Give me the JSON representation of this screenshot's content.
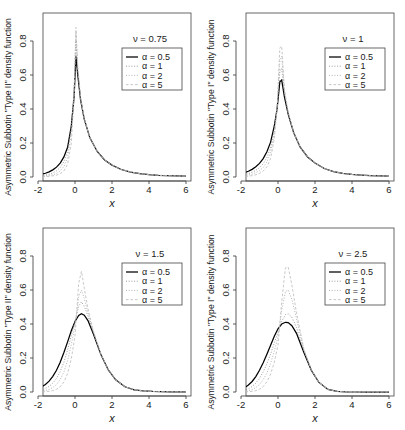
{
  "figure": {
    "layout": "2x2 grid of density plots",
    "panel_count": 4
  },
  "axes": {
    "xlabel": "x",
    "x_ticks": [
      "-2",
      "0",
      "2",
      "4",
      "6"
    ],
    "y_ticks": [
      "0.0",
      "0.2",
      "0.4",
      "0.6",
      "0.8"
    ],
    "xlim": [
      -2,
      6
    ],
    "ylim": [
      0,
      0.92
    ]
  },
  "legend": {
    "entries": [
      {
        "label": "α = 0.5",
        "style": "solid",
        "color": "#000000"
      },
      {
        "label": "α = 1",
        "style": "dotted",
        "color": "#8a8a8a"
      },
      {
        "label": "α = 2",
        "style": "dotted",
        "color": "#a8a8a8"
      },
      {
        "label": "α = 5",
        "style": "dashed",
        "color": "#bdbdbd"
      }
    ]
  },
  "panels": [
    {
      "id": "panel-top-left",
      "nu_label": "ν = 0.75",
      "ylabel": "Asymmetric Subbotin \"Type II\" density function",
      "type": "II",
      "nu": 0.75
    },
    {
      "id": "panel-top-right",
      "nu_label": "ν = 1",
      "ylabel": "Asymmetric Subbotin \"Type I\" density function",
      "type": "I",
      "nu": 1
    },
    {
      "id": "panel-bottom-left",
      "nu_label": "ν = 1.5",
      "ylabel": "Asymmetric Subbotin \"Type II\" density function",
      "type": "II",
      "nu": 1.5
    },
    {
      "id": "panel-bottom-right",
      "nu_label": "ν = 2.5",
      "ylabel": "Asymmetric Subbotin \"Type I\" density function",
      "type": "I",
      "nu": 2.5
    }
  ],
  "chart_data": [
    {
      "type": "line",
      "title": "ν = 0.75",
      "xlabel": "x",
      "ylabel": "Asymmetric Subbotin \"Type II\" density function",
      "xlim": [
        -2,
        6
      ],
      "ylim": [
        0,
        0.92
      ],
      "grid": false,
      "legend_position": "upper-right",
      "x": [
        -2,
        -1.8,
        -1.6,
        -1.4,
        -1.2,
        -1,
        -0.8,
        -0.6,
        -0.4,
        -0.2,
        -0.05,
        0.05,
        0.15,
        0.3,
        0.5,
        0.8,
        1.2,
        1.6,
        2,
        2.5,
        3,
        3.5,
        4,
        4.5,
        5,
        5.5,
        6
      ],
      "series": [
        {
          "name": "α = 0.5",
          "peak": 0.71,
          "peak_x": 0.1,
          "values": [
            0.012,
            0.016,
            0.022,
            0.03,
            0.042,
            0.058,
            0.082,
            0.118,
            0.175,
            0.3,
            0.47,
            0.71,
            0.6,
            0.455,
            0.34,
            0.232,
            0.15,
            0.1,
            0.07,
            0.044,
            0.029,
            0.02,
            0.014,
            0.01,
            0.008,
            0.006,
            0.005
          ]
        },
        {
          "name": "α = 1",
          "peak": 0.8,
          "peak_x": 0.08,
          "values": [
            0.006,
            0.008,
            0.011,
            0.016,
            0.024,
            0.036,
            0.056,
            0.09,
            0.15,
            0.29,
            0.5,
            0.8,
            0.62,
            0.46,
            0.34,
            0.232,
            0.15,
            0.1,
            0.07,
            0.044,
            0.029,
            0.02,
            0.014,
            0.01,
            0.008,
            0.006,
            0.005
          ]
        },
        {
          "name": "α = 2",
          "peak": 0.85,
          "peak_x": 0.07,
          "values": [
            0.003,
            0.004,
            0.006,
            0.009,
            0.013,
            0.021,
            0.035,
            0.062,
            0.115,
            0.255,
            0.5,
            0.85,
            0.64,
            0.465,
            0.342,
            0.232,
            0.15,
            0.1,
            0.07,
            0.044,
            0.029,
            0.02,
            0.014,
            0.01,
            0.008,
            0.006,
            0.005
          ]
        },
        {
          "name": "α = 5",
          "peak": 0.88,
          "peak_x": 0.06,
          "values": [
            0.001,
            0.002,
            0.003,
            0.004,
            0.007,
            0.011,
            0.019,
            0.036,
            0.075,
            0.2,
            0.47,
            0.88,
            0.65,
            0.47,
            0.345,
            0.233,
            0.15,
            0.1,
            0.07,
            0.044,
            0.029,
            0.02,
            0.014,
            0.01,
            0.008,
            0.006,
            0.005
          ]
        }
      ]
    },
    {
      "type": "line",
      "title": "ν = 1",
      "xlabel": "x",
      "ylabel": "Asymmetric Subbotin \"Type I\" density function",
      "xlim": [
        -2,
        6
      ],
      "ylim": [
        0,
        0.92
      ],
      "grid": false,
      "legend_position": "upper-right",
      "x": [
        -2,
        -1.8,
        -1.6,
        -1.4,
        -1.2,
        -1,
        -0.8,
        -0.6,
        -0.4,
        -0.2,
        -0.05,
        0.1,
        0.2,
        0.35,
        0.55,
        0.85,
        1.2,
        1.6,
        2,
        2.5,
        3,
        3.5,
        4,
        4.5,
        5,
        5.5,
        6
      ],
      "series": [
        {
          "name": "α = 0.5",
          "peak": 0.57,
          "peak_x": 0.18,
          "values": [
            0.02,
            0.026,
            0.034,
            0.045,
            0.06,
            0.08,
            0.108,
            0.148,
            0.205,
            0.3,
            0.4,
            0.56,
            0.57,
            0.47,
            0.37,
            0.26,
            0.175,
            0.118,
            0.082,
            0.05,
            0.032,
            0.021,
            0.015,
            0.011,
            0.008,
            0.006,
            0.005
          ]
        },
        {
          "name": "α = 1",
          "peak": 0.64,
          "peak_x": 0.16,
          "values": [
            0.011,
            0.015,
            0.02,
            0.028,
            0.039,
            0.055,
            0.078,
            0.114,
            0.172,
            0.28,
            0.405,
            0.62,
            0.64,
            0.49,
            0.375,
            0.26,
            0.175,
            0.118,
            0.082,
            0.05,
            0.032,
            0.021,
            0.015,
            0.011,
            0.008,
            0.006,
            0.005
          ]
        },
        {
          "name": "α = 2",
          "peak": 0.71,
          "peak_x": 0.15,
          "values": [
            0.006,
            0.008,
            0.012,
            0.017,
            0.025,
            0.037,
            0.056,
            0.088,
            0.143,
            0.258,
            0.405,
            0.69,
            0.71,
            0.505,
            0.38,
            0.261,
            0.175,
            0.118,
            0.082,
            0.05,
            0.032,
            0.021,
            0.015,
            0.011,
            0.008,
            0.006,
            0.005
          ]
        },
        {
          "name": "α = 5",
          "peak": 0.77,
          "peak_x": 0.14,
          "values": [
            0.002,
            0.003,
            0.005,
            0.008,
            0.013,
            0.021,
            0.035,
            0.06,
            0.108,
            0.225,
            0.395,
            0.76,
            0.77,
            0.515,
            0.383,
            0.262,
            0.175,
            0.118,
            0.082,
            0.05,
            0.032,
            0.021,
            0.015,
            0.011,
            0.008,
            0.006,
            0.005
          ]
        }
      ]
    },
    {
      "type": "line",
      "title": "ν = 1.5",
      "xlabel": "x",
      "ylabel": "Asymmetric Subbotin \"Type II\" density function",
      "xlim": [
        -2,
        6
      ],
      "ylim": [
        0,
        0.92
      ],
      "grid": false,
      "legend_position": "upper-right",
      "x": [
        -2,
        -1.8,
        -1.6,
        -1.4,
        -1.2,
        -1,
        -0.8,
        -0.6,
        -0.4,
        -0.2,
        0,
        0.2,
        0.35,
        0.5,
        0.7,
        1,
        1.4,
        1.8,
        2.2,
        2.7,
        3.2,
        3.7,
        4.2,
        4.7,
        5.2,
        5.6,
        6
      ],
      "series": [
        {
          "name": "α = 0.5",
          "peak": 0.46,
          "peak_x": 0.35,
          "values": [
            0.02,
            0.03,
            0.044,
            0.064,
            0.092,
            0.128,
            0.175,
            0.232,
            0.295,
            0.36,
            0.415,
            0.45,
            0.46,
            0.452,
            0.42,
            0.34,
            0.22,
            0.13,
            0.072,
            0.031,
            0.013,
            0.006,
            0.003,
            0.002,
            0.001,
            0.001,
            0.001
          ]
        },
        {
          "name": "α = 1",
          "peak": 0.53,
          "peak_x": 0.33,
          "values": [
            0.008,
            0.013,
            0.021,
            0.033,
            0.052,
            0.08,
            0.12,
            0.175,
            0.248,
            0.33,
            0.415,
            0.505,
            0.53,
            0.505,
            0.448,
            0.348,
            0.222,
            0.13,
            0.072,
            0.031,
            0.013,
            0.006,
            0.003,
            0.002,
            0.001,
            0.001,
            0.001
          ]
        },
        {
          "name": "α = 2",
          "peak": 0.6,
          "peak_x": 0.32,
          "values": [
            0.003,
            0.005,
            0.009,
            0.015,
            0.026,
            0.044,
            0.073,
            0.118,
            0.186,
            0.278,
            0.39,
            0.56,
            0.6,
            0.55,
            0.468,
            0.352,
            0.222,
            0.13,
            0.072,
            0.031,
            0.013,
            0.006,
            0.003,
            0.002,
            0.001,
            0.001,
            0.001
          ]
        },
        {
          "name": "α = 5",
          "peak": 0.71,
          "peak_x": 0.3,
          "values": [
            0.001,
            0.001,
            0.002,
            0.004,
            0.008,
            0.016,
            0.031,
            0.059,
            0.108,
            0.195,
            0.33,
            0.64,
            0.71,
            0.61,
            0.49,
            0.357,
            0.223,
            0.13,
            0.072,
            0.031,
            0.013,
            0.006,
            0.003,
            0.002,
            0.001,
            0.001,
            0.001
          ]
        }
      ]
    },
    {
      "type": "line",
      "title": "ν = 2.5",
      "xlabel": "x",
      "ylabel": "Asymmetric Subbotin \"Type I\" density function",
      "xlim": [
        -2,
        6
      ],
      "ylim": [
        0,
        0.92
      ],
      "grid": false,
      "legend_position": "upper-right",
      "x": [
        -2,
        -1.8,
        -1.6,
        -1.4,
        -1.2,
        -1,
        -0.8,
        -0.6,
        -0.4,
        -0.2,
        0,
        0.2,
        0.4,
        0.55,
        0.75,
        1,
        1.4,
        1.8,
        2.2,
        2.7,
        3.2,
        3.7,
        4.2,
        4.7,
        5.2,
        5.6,
        6
      ],
      "series": [
        {
          "name": "α = 0.5",
          "peak": 0.41,
          "peak_x": 0.52,
          "values": [
            0.016,
            0.026,
            0.041,
            0.062,
            0.091,
            0.128,
            0.172,
            0.222,
            0.275,
            0.328,
            0.372,
            0.4,
            0.41,
            0.408,
            0.39,
            0.345,
            0.232,
            0.128,
            0.058,
            0.015,
            0.004,
            0.001,
            0.0,
            0.0,
            0.0,
            0.0,
            0.0
          ]
        },
        {
          "name": "α = 1",
          "peak": 0.46,
          "peak_x": 0.48,
          "values": [
            0.006,
            0.011,
            0.019,
            0.032,
            0.052,
            0.08,
            0.118,
            0.166,
            0.224,
            0.288,
            0.352,
            0.415,
            0.455,
            0.46,
            0.44,
            0.38,
            0.242,
            0.13,
            0.058,
            0.015,
            0.004,
            0.001,
            0.0,
            0.0,
            0.0,
            0.0,
            0.0
          ]
        },
        {
          "name": "α = 2",
          "peak": 0.6,
          "peak_x": 0.46,
          "values": [
            0.002,
            0.004,
            0.008,
            0.014,
            0.026,
            0.044,
            0.072,
            0.112,
            0.168,
            0.24,
            0.325,
            0.48,
            0.59,
            0.6,
            0.545,
            0.432,
            0.25,
            0.131,
            0.058,
            0.015,
            0.004,
            0.001,
            0.0,
            0.0,
            0.0,
            0.0,
            0.0
          ]
        },
        {
          "name": "α = 5",
          "peak": 0.74,
          "peak_x": 0.44,
          "values": [
            0.0,
            0.001,
            0.002,
            0.004,
            0.008,
            0.016,
            0.032,
            0.06,
            0.105,
            0.175,
            0.275,
            0.53,
            0.73,
            0.735,
            0.63,
            0.465,
            0.252,
            0.132,
            0.058,
            0.015,
            0.004,
            0.001,
            0.0,
            0.0,
            0.0,
            0.0,
            0.0
          ]
        }
      ]
    }
  ]
}
